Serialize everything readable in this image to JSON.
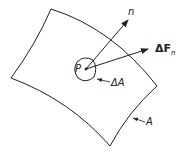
{
  "diagram": {
    "labels": {
      "normal": "n",
      "force": "ΔF",
      "force_sub": "n",
      "point": "P",
      "area_element": "ΔA",
      "surface": "A"
    },
    "colors": {
      "stroke": "#222222",
      "background": "#ffffff"
    }
  }
}
